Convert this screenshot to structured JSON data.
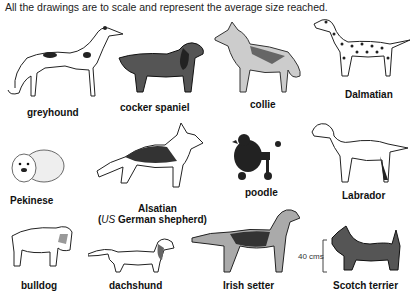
{
  "caption": "All the drawings are to scale and represent the average size reached.",
  "scale_bar": {
    "label": "40 cms"
  },
  "dogs": [
    {
      "name": "greyhound"
    },
    {
      "name": "cocker spaniel"
    },
    {
      "name": "collie"
    },
    {
      "name": "Dalmatian"
    },
    {
      "name": "Pekinese"
    },
    {
      "name": "Alsatian",
      "note_prefix": "US",
      "note_text": " German shepherd"
    },
    {
      "name": "poodle"
    },
    {
      "name": "Labrador"
    },
    {
      "name": "bulldog"
    },
    {
      "name": "dachshund"
    },
    {
      "name": "Irish setter"
    },
    {
      "name": "Scotch terrier"
    }
  ]
}
